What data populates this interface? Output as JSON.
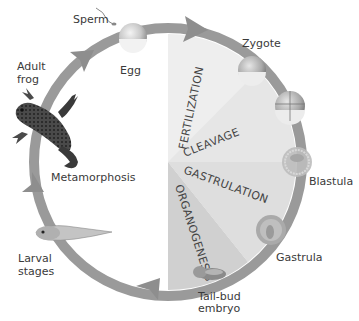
{
  "diagram": {
    "stage_labels": {
      "sperm": "Sperm",
      "egg": "Egg",
      "zygote": "Zygote",
      "blastula": "Blastula",
      "gastrula": "Gastrula",
      "tailbud_line1": "Tail-bud",
      "tailbud_line2": "embryo",
      "larval_line1": "Larval",
      "larval_line2": "stages",
      "metamorphosis": "Metamorphosis",
      "adult_line1": "Adult",
      "adult_line2": "frog"
    },
    "process_wedges": [
      {
        "label": "FERTILIZATION",
        "color": "#ececec"
      },
      {
        "label": "CLEAVAGE",
        "color": "#e4e4e4"
      },
      {
        "label": "GASTRULATION",
        "color": "#dcdcdc"
      },
      {
        "label": "ORGANOGENESIS",
        "color": "#cfcfcf"
      }
    ],
    "colors": {
      "ring": "#9a9a9a",
      "text": "#3a3a3a",
      "background": "#ffffff"
    }
  }
}
